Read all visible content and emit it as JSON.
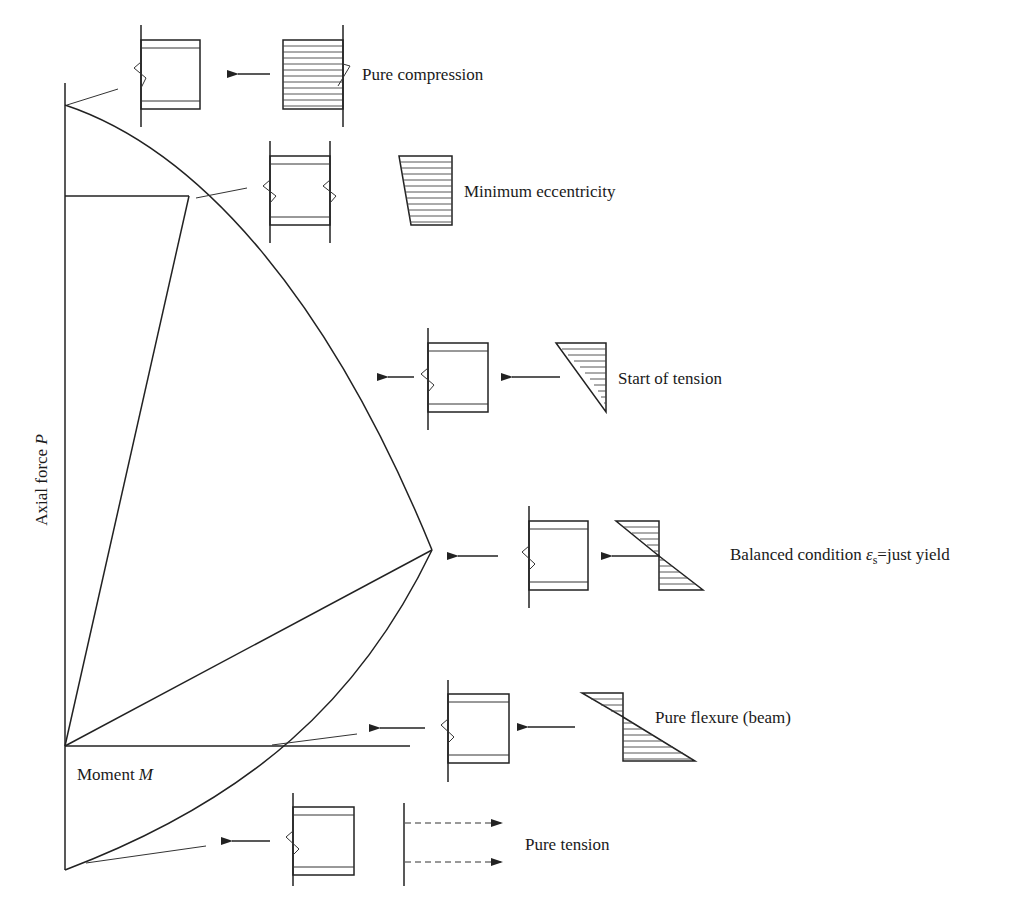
{
  "diagram": {
    "axes": {
      "y_label_main": "Axial force ",
      "y_label_var": "P",
      "x_label_main": "Moment ",
      "x_label_var": "M"
    },
    "states": [
      {
        "id": "pure-compression",
        "label": "Pure compression"
      },
      {
        "id": "minimum-eccentricity",
        "label": "Minimum eccentricity"
      },
      {
        "id": "start-of-tension",
        "label": "Start of tension"
      },
      {
        "id": "balanced-condition",
        "label_main": "Balanced condition ",
        "label_symbol": "ε",
        "label_sub": "s",
        "label_rest": "=just yield"
      },
      {
        "id": "pure-flexure",
        "label": "Pure flexure (beam)"
      },
      {
        "id": "pure-tension",
        "label": "Pure tension"
      }
    ],
    "colors": {
      "line": "#222222",
      "background": "#ffffff"
    }
  }
}
